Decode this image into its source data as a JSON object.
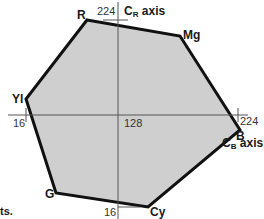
{
  "diagram": {
    "type": "color-gamut-hexagon",
    "fill_color": "#cfcfcf",
    "outline_color": "#111111",
    "axis_color": "#555555",
    "axes": {
      "cr": {
        "label_main": "C",
        "label_sub": "R",
        "label_suffix": " axis",
        "max_tick": "224",
        "min_tick": "16"
      },
      "cb": {
        "label_main": "C",
        "label_sub": "B",
        "label_suffix": " axis",
        "max_tick": "224",
        "min_tick": "16"
      },
      "center_tick": "128"
    },
    "vertices": [
      {
        "name": "R",
        "x": 87,
        "y": 20
      },
      {
        "name": "Mg",
        "x": 180,
        "y": 36
      },
      {
        "name": "B",
        "x": 240,
        "y": 130
      },
      {
        "name": "Cy",
        "x": 148,
        "y": 207
      },
      {
        "name": "G",
        "x": 56,
        "y": 193
      },
      {
        "name": "Yl",
        "x": 26,
        "y": 99
      }
    ],
    "fragment_text": "ts."
  }
}
